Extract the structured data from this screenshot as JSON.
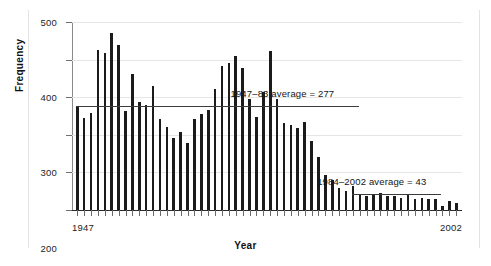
{
  "figure": {
    "background": "#ffffff",
    "bar_color": "#1b1b1b",
    "grid_color": "#e6e6e6",
    "axis_color": "#6f6f6f"
  },
  "axes": {
    "y_title": "Frequency",
    "x_title": "Year",
    "x_start_label": "1947",
    "x_end_label": "2002"
  },
  "annotations": {
    "avg1_label": "1947–83 average  =  277",
    "avg2_label": "1984–2002 average  =  43"
  },
  "chart_data": {
    "type": "bar",
    "title": "",
    "xlabel": "Year",
    "ylabel": "Frequency",
    "ylim": [
      0,
      500
    ],
    "yticks": [
      0,
      100,
      200,
      300,
      400,
      500
    ],
    "ytick_labels": [
      "0",
      "100",
      "200",
      "300",
      "400",
      "500"
    ],
    "grid": true,
    "legend": "none",
    "x_axis_endpoints": [
      "1947",
      "2002"
    ],
    "categories": [
      "1947",
      "1948",
      "1949",
      "1950",
      "1951",
      "1952",
      "1953",
      "1954",
      "1955",
      "1956",
      "1957",
      "1958",
      "1959",
      "1960",
      "1961",
      "1962",
      "1963",
      "1964",
      "1965",
      "1966",
      "1967",
      "1968",
      "1969",
      "1970",
      "1971",
      "1972",
      "1973",
      "1974",
      "1975",
      "1976",
      "1977",
      "1978",
      "1979",
      "1980",
      "1981",
      "1982",
      "1983",
      "1984",
      "1985",
      "1986",
      "1987",
      "1988",
      "1989",
      "1990",
      "1991",
      "1992",
      "1993",
      "1994",
      "1995",
      "1996",
      "1997",
      "1998",
      "1999",
      "2000",
      "2001",
      "2002"
    ],
    "values": [
      273,
      245,
      259,
      425,
      417,
      471,
      439,
      264,
      363,
      287,
      279,
      331,
      243,
      220,
      192,
      208,
      178,
      243,
      256,
      265,
      321,
      382,
      391,
      410,
      378,
      295,
      248,
      315,
      422,
      295,
      232,
      227,
      217,
      233,
      184,
      141,
      93,
      79,
      59,
      50,
      65,
      39,
      37,
      39,
      44,
      37,
      36,
      33,
      40,
      28,
      31,
      30,
      29,
      12,
      25,
      18
    ],
    "reference_lines": [
      {
        "name": "1947–83 average",
        "value": 277,
        "label": "1947–83 average  =  277",
        "span_categories": [
          "1947",
          "1988"
        ]
      },
      {
        "name": "1984–2002 average",
        "value": 43,
        "label": "1984–2002 average  =  43",
        "span_categories": [
          "1987",
          "2000"
        ]
      }
    ]
  }
}
